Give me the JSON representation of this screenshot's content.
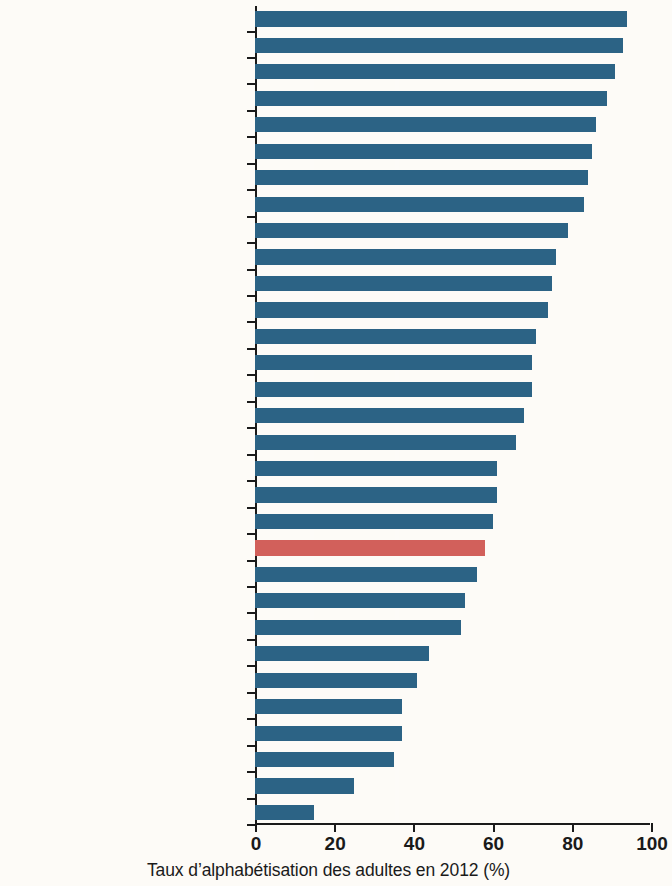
{
  "chart_data": {
    "type": "bar",
    "orientation": "horizontal",
    "title": "",
    "xlabel": "Taux d’alphabétisation des adultes en 2012 (%)",
    "ylabel": "",
    "xlim": [
      0,
      100
    ],
    "xticks": [
      0,
      20,
      40,
      60,
      80,
      100
    ],
    "xtick_labels": [
      "0",
      "20",
      "40",
      "60",
      "80",
      "100"
    ],
    "grid": false,
    "legend": false,
    "colors": {
      "bar_default": "#2c6385",
      "bar_highlight": "#d2605b",
      "axis": "#1a1a1a",
      "background": "#fdfbf7"
    },
    "highlight_category": "Afrique",
    "categories": [
      "Guinée équatoriale",
      "Afrique du Sud",
      "Seychelles",
      "Maurice",
      "Botswana",
      "Cabo Verde",
      "Swaziland",
      "Zimbabwe",
      "République du Congo",
      "Comores",
      "Ouganda",
      "Ghana",
      "Cameroun",
      "Angola",
      "Érythrée",
      "Tanzanie",
      "Rwanda",
      "Malawi",
      "Zambie",
      "Togo",
      "Afrique",
      "Guinée-Bissau",
      "Sénégal",
      "Gambie",
      "Sierra Leone",
      "Côte d’Ivoire",
      "Tchad",
      "République centrafricaine",
      "Mali",
      "Guinée",
      "Niger"
    ],
    "values": [
      94,
      93,
      91,
      89,
      86,
      85,
      84,
      83,
      79,
      76,
      75,
      74,
      71,
      70,
      70,
      68,
      66,
      61,
      61,
      60,
      58,
      56,
      53,
      52,
      44,
      41,
      37,
      37,
      35,
      25,
      15
    ],
    "bars": [
      {
        "label": "Guinée équatoriale",
        "value": 94,
        "highlight": false
      },
      {
        "label": "Afrique du Sud",
        "value": 93,
        "highlight": false
      },
      {
        "label": "Seychelles",
        "value": 91,
        "highlight": false
      },
      {
        "label": "Maurice",
        "value": 89,
        "highlight": false
      },
      {
        "label": "Botswana",
        "value": 86,
        "highlight": false
      },
      {
        "label": "Cabo Verde",
        "value": 85,
        "highlight": false
      },
      {
        "label": "Swaziland",
        "value": 84,
        "highlight": false
      },
      {
        "label": "Zimbabwe",
        "value": 83,
        "highlight": false
      },
      {
        "label": "République du Congo",
        "value": 79,
        "highlight": false
      },
      {
        "label": "Comores",
        "value": 76,
        "highlight": false
      },
      {
        "label": "Ouganda",
        "value": 75,
        "highlight": false
      },
      {
        "label": "Ghana",
        "value": 74,
        "highlight": false
      },
      {
        "label": "Cameroun",
        "value": 71,
        "highlight": false
      },
      {
        "label": "Angola",
        "value": 70,
        "highlight": false
      },
      {
        "label": "Érythrée",
        "value": 70,
        "highlight": false
      },
      {
        "label": "Tanzanie",
        "value": 68,
        "highlight": false
      },
      {
        "label": "Rwanda",
        "value": 66,
        "highlight": false
      },
      {
        "label": "Malawi",
        "value": 61,
        "highlight": false
      },
      {
        "label": "Zambie",
        "value": 61,
        "highlight": false
      },
      {
        "label": "Togo",
        "value": 60,
        "highlight": false
      },
      {
        "label": "Afrique",
        "value": 58,
        "highlight": true
      },
      {
        "label": "Guinée-Bissau",
        "value": 56,
        "highlight": false
      },
      {
        "label": "Sénégal",
        "value": 53,
        "highlight": false
      },
      {
        "label": "Gambie",
        "value": 52,
        "highlight": false
      },
      {
        "label": "Sierra Leone",
        "value": 44,
        "highlight": false
      },
      {
        "label": "Côte d’Ivoire",
        "value": 41,
        "highlight": false
      },
      {
        "label": "Tchad",
        "value": 37,
        "highlight": false
      },
      {
        "label": "République centrafricaine",
        "value": 37,
        "highlight": false
      },
      {
        "label": "Mali",
        "value": 35,
        "highlight": false
      },
      {
        "label": "Guinée",
        "value": 25,
        "highlight": false
      },
      {
        "label": "Niger",
        "value": 15,
        "highlight": false
      }
    ]
  }
}
